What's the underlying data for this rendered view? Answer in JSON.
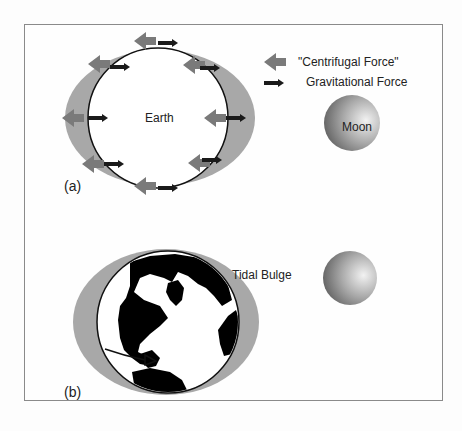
{
  "figure": {
    "panel_a": {
      "label": "(a)",
      "earth_label": "Earth",
      "moon_label": "Moon",
      "legend": {
        "centrifugal": "\"Centrifugal Force\"",
        "gravitational": "Gravitational Force"
      }
    },
    "panel_b": {
      "label": "(b)",
      "bulge_label": "Tidal Bulge"
    },
    "colors": {
      "bulge": "#a8a8a8",
      "centrifugal_arrow": "#7a7a7a",
      "gravitational_arrow": "#1a1a1a",
      "land": "#000000",
      "frame": "#8a8a8a"
    }
  }
}
